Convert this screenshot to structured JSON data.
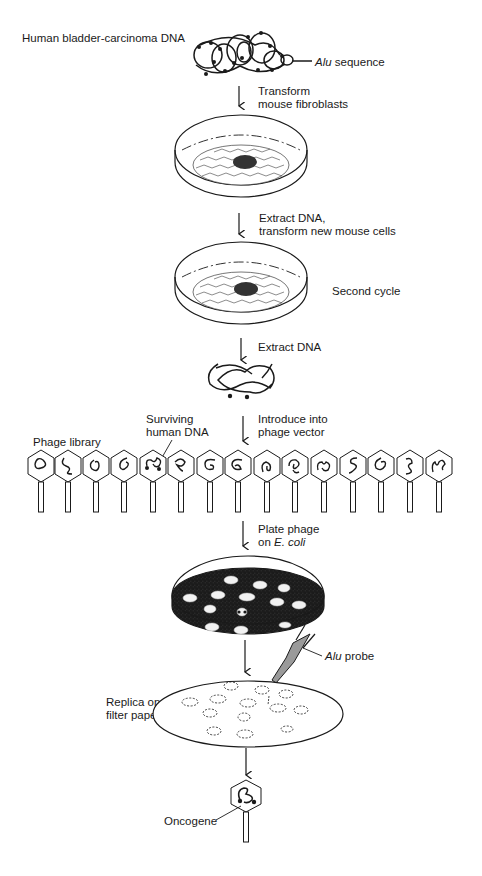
{
  "diagram": {
    "title_label": "Human bladder-carcinoma DNA",
    "alu_sequence_label_italic": "Alu",
    "alu_sequence_label_rest": " sequence",
    "steps": [
      {
        "line1": "Transform",
        "line2": "mouse fibroblasts"
      },
      {
        "line1": "Extract DNA,",
        "line2": "transform new mouse cells"
      },
      {
        "line1": "Extract DNA",
        "line2": ""
      },
      {
        "line1": "Introduce into",
        "line2": "phage vector"
      },
      {
        "line1": "Plate phage",
        "line2_prefix": "on ",
        "line2_italic": "E. coli"
      }
    ],
    "second_cycle_label": "Second cycle",
    "surviving_dna_label_line1": "Surviving",
    "surviving_dna_label_line2": "human DNA",
    "phage_library_label": "Phage library",
    "phage_count": 15,
    "alu_probe_label_italic": "Alu",
    "alu_probe_label_rest": " probe",
    "replica_label_line1": "Replica on",
    "replica_label_line2": "filter paper",
    "oncogene_label": "Oncogene",
    "colors": {
      "ink": "#1a1a1a",
      "transformed_focus": "#333333",
      "probe_fill": "#9a9a9a",
      "lawn": "#2b2b2b"
    }
  }
}
